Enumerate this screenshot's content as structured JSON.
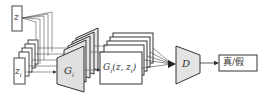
{
  "diagram": {
    "title": "",
    "nodes": {
      "global_noise": {
        "label": "z"
      },
      "local_noise": {
        "label": "z",
        "subscript": "i"
      },
      "generator": {
        "label": "G",
        "subscript": "i"
      },
      "generated": {
        "label": "G",
        "subscript": "i",
        "args": "(z, z",
        "args_sub": "i",
        "args_end": ")"
      },
      "discriminator": {
        "label": "D"
      },
      "output": {
        "label": "真/假"
      }
    },
    "edges": [
      {
        "from": "global_noise",
        "to": "generator"
      },
      {
        "from": "local_noise",
        "to": "generator"
      },
      {
        "from": "generator",
        "to": "generated"
      },
      {
        "from": "generated",
        "to": "discriminator"
      },
      {
        "from": "discriminator",
        "to": "output"
      }
    ],
    "colors": {
      "stroke": "#444444",
      "panel_fill": "#e4e4e4",
      "page_fill": "#ffffff",
      "background": "#ffffff"
    }
  }
}
